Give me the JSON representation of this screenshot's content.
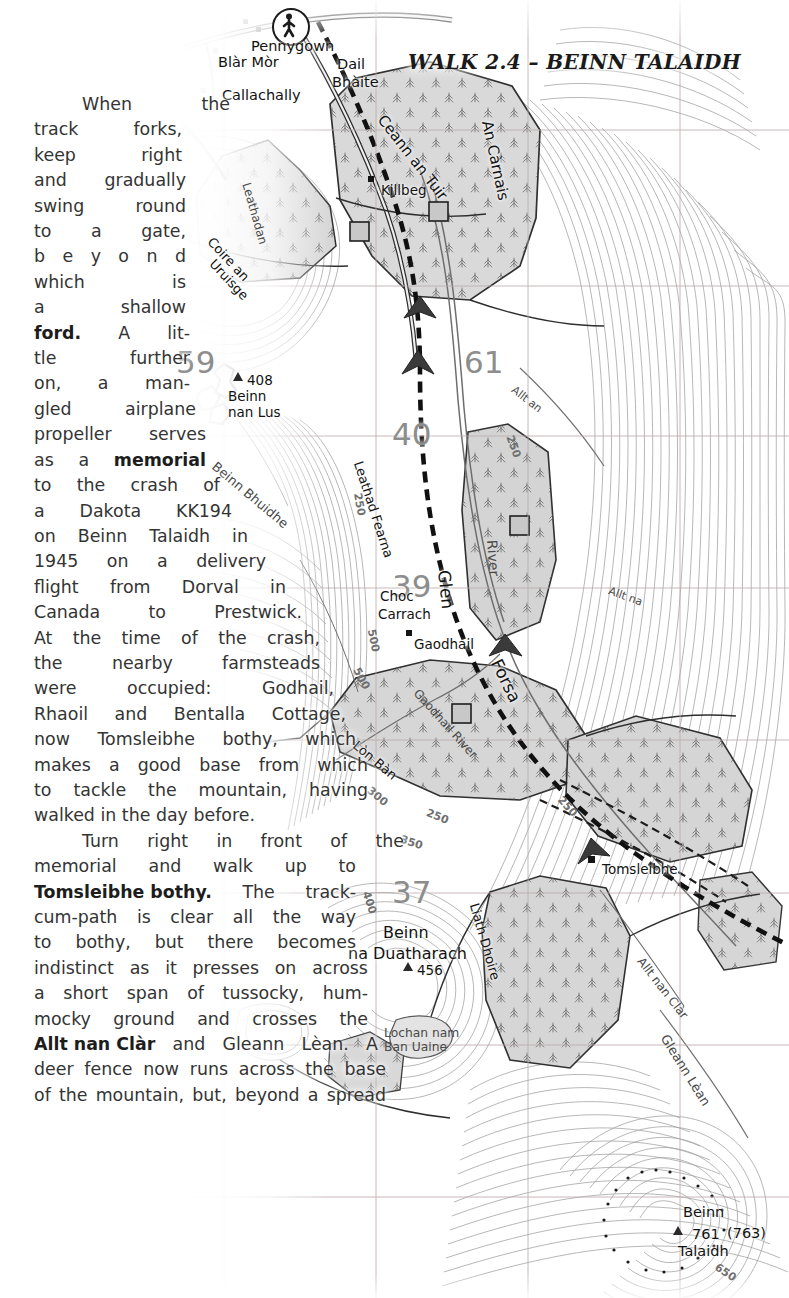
{
  "page": {
    "width": 789,
    "height": 1298,
    "background": "#ffffff"
  },
  "header": {
    "prefix": "W",
    "text_main": "ALK 2.4 – ",
    "full": "WALK 2.4 – BEINN TALAIDH",
    "parts": [
      "W",
      "ALK",
      " 2.4 – ",
      "B",
      "EINN",
      " T",
      "ALAIDH"
    ]
  },
  "article": {
    "paragraphs": [
      {
        "id": "para-1",
        "indent": true,
        "lines": [
          {
            "words": [
              "When",
              "the"
            ],
            "width_class": "w1",
            "indent": true
          },
          {
            "words": [
              "track",
              "forks,"
            ],
            "width_class": "w1"
          },
          {
            "words": [
              "keep",
              "right"
            ],
            "width_class": "w1"
          },
          {
            "words": [
              "and",
              "gradually"
            ],
            "width_class": "w2"
          },
          {
            "words": [
              "swing",
              "round"
            ],
            "width_class": "w2"
          },
          {
            "words": [
              "to",
              "a",
              "gate,"
            ],
            "width_class": "w2"
          },
          {
            "words": [
              "b",
              "e",
              "y",
              "o",
              "n",
              "d"
            ],
            "width_class": "w2"
          },
          {
            "words": [
              "which",
              "is"
            ],
            "width_class": "w2"
          },
          {
            "words": [
              "a",
              "shallow"
            ],
            "width_class": "w2"
          },
          {
            "words": [
              "ford.",
              "A",
              "lit-"
            ],
            "width_class": "w3",
            "bold_first": true
          },
          {
            "words": [
              "tle",
              "further"
            ],
            "width_class": "w3"
          },
          {
            "words": [
              "on,",
              "a",
              "man-"
            ],
            "width_class": "w3"
          },
          {
            "words": [
              "gled",
              "airplane"
            ],
            "width_class": "w4"
          },
          {
            "words": [
              "propeller",
              "serves"
            ],
            "width_class": "w5"
          },
          {
            "words": [
              "as",
              "a",
              "memorial"
            ],
            "width_class": "w5",
            "bold_last": true
          },
          {
            "words": [
              "to",
              "the",
              "crash",
              "of"
            ],
            "width_class": "w6"
          },
          {
            "words": [
              "a",
              "Dakota",
              "KK194"
            ],
            "width_class": "w7"
          },
          {
            "words": [
              "on",
              "Beinn",
              "Talaidh",
              "in"
            ],
            "width_class": "w8"
          },
          {
            "words": [
              "1945",
              "on",
              "a",
              "delivery"
            ],
            "width_class": "w9"
          },
          {
            "words": [
              "flight",
              "from",
              "Dorval",
              "in"
            ],
            "width_class": "w10"
          },
          {
            "words": [
              "Canada",
              "to",
              "Prestwick."
            ],
            "width_class": "w11"
          },
          {
            "words": [
              "At",
              "the",
              "time",
              "of",
              "the",
              "crash,"
            ],
            "width_class": "w12"
          },
          {
            "words": [
              "the",
              "nearby",
              "farmsteads"
            ],
            "width_class": "w12"
          },
          {
            "words": [
              "were",
              "occupied:",
              "Godhail,"
            ],
            "width_class": "w13"
          },
          {
            "words": [
              "Rhaoil",
              "and",
              "Bentalla",
              "Cottage,"
            ],
            "width_class": "w14"
          },
          {
            "words": [
              "now",
              "Tomsleibhe",
              "bothy,",
              "which"
            ],
            "width_class": "w15"
          },
          {
            "words": [
              "makes",
              "a",
              "good",
              "base",
              "from",
              "which"
            ],
            "width_class": "w16"
          },
          {
            "words": [
              "to",
              "tackle",
              "the",
              "mountain,",
              "having"
            ],
            "width_class": "w16"
          },
          {
            "words": [
              "walked",
              "in",
              "the",
              "day",
              "before."
            ],
            "width_class": "w16",
            "ragged": true
          }
        ]
      },
      {
        "id": "para-2",
        "indent": true,
        "lines": [
          {
            "words": [
              "Turn",
              "right",
              "in",
              "front",
              "of",
              "the"
            ],
            "width_class": "w15",
            "indent": true
          },
          {
            "words": [
              "memorial",
              "and",
              "walk",
              "up",
              "to"
            ],
            "width_class": "w15"
          },
          {
            "words": [
              "Tomsleibhe bothy.",
              "The",
              "track-"
            ],
            "width_class": "w15",
            "bold_first": true
          },
          {
            "words": [
              "cum-path",
              "is",
              "clear",
              "all",
              "the",
              "way"
            ],
            "width_class": "w15"
          },
          {
            "words": [
              "to",
              "bothy,",
              "but",
              "there",
              "becomes"
            ],
            "width_class": "w15"
          },
          {
            "words": [
              "indistinct",
              "as",
              "it",
              "presses",
              "on",
              "across"
            ],
            "width_class": "w16"
          },
          {
            "words": [
              "a",
              "short",
              "span",
              "of",
              "tussocky,",
              "hum-"
            ],
            "width_class": "w16"
          },
          {
            "words": [
              "mocky",
              "ground",
              "and",
              "crosses",
              "the"
            ],
            "width_class": "w16"
          },
          {
            "words": [
              "Allt nan Clàr",
              "and",
              "Gleann",
              "Lèan.",
              "A"
            ],
            "width_class": "w17",
            "bold_first": true
          },
          {
            "words": [
              "deer",
              "fence",
              "now",
              "runs",
              "across",
              "the",
              "base"
            ],
            "width_class": "w18"
          },
          {
            "words": [
              "of",
              "the",
              "mountain,",
              "but,",
              "beyond",
              "a",
              "spread"
            ],
            "width_class": "w18",
            "ragged": true
          }
        ]
      }
    ]
  },
  "map": {
    "type": "ordnance-survey-topographic",
    "region": "Isle of Mull, Glen Forsa",
    "colors": {
      "contour": "#8a8a8a",
      "forest_fill": "#d6d6d6",
      "forest_fill_dark": "#c4c4c4",
      "grid": "#b0a0a0",
      "road": "#2a2a2a",
      "water": "#7d7d7d",
      "label": "#121212",
      "paper": "#ffffff"
    },
    "grid_numbers": [
      {
        "label": "59",
        "x": 176,
        "y": 344
      },
      {
        "label": "61",
        "x": 464,
        "y": 344
      },
      {
        "label": "40",
        "x": 392,
        "y": 416
      },
      {
        "label": "39",
        "x": 392,
        "y": 568
      },
      {
        "label": "37",
        "x": 392,
        "y": 874
      }
    ],
    "place_labels": [
      {
        "name": "Pennygown",
        "x": 251,
        "y": 38,
        "size": "sz14"
      },
      {
        "name": "Blàr Mòr",
        "x": 218,
        "y": 54,
        "size": "sz14"
      },
      {
        "name": "Callachally",
        "x": 222,
        "y": 87,
        "size": "sz14"
      },
      {
        "name": "Dail",
        "x": 337,
        "y": 56,
        "size": "sz14"
      },
      {
        "name": "Bhàite",
        "x": 332,
        "y": 74,
        "size": "sz14"
      },
      {
        "name": "Killbeg",
        "x": 381,
        "y": 182,
        "size": "sz13"
      },
      {
        "name": "Beinn",
        "x": 228,
        "y": 388,
        "size": "sz13"
      },
      {
        "name": "nan Lus",
        "x": 228,
        "y": 404,
        "size": "sz13"
      },
      {
        "name": "408",
        "x": 247,
        "y": 374,
        "size": "sz13"
      },
      {
        "name": "Choc",
        "x": 380,
        "y": 588,
        "size": "sz13"
      },
      {
        "name": "Carrach",
        "x": 378,
        "y": 606,
        "size": "sz13"
      },
      {
        "name": "Gaodhail",
        "x": 414,
        "y": 636,
        "size": "sz13"
      },
      {
        "name": "Tomsleibhe",
        "x": 602,
        "y": 861,
        "size": "sz13"
      },
      {
        "name": "Beinn",
        "x": 383,
        "y": 923,
        "size": "sz15"
      },
      {
        "name": "na Duatharach",
        "x": 348,
        "y": 944,
        "size": "sz15"
      },
      {
        "name": "456",
        "x": 417,
        "y": 966,
        "size": "sz13"
      },
      {
        "name": "Lochan nam",
        "x": 384,
        "y": 1026,
        "size": "sz12"
      },
      {
        "name": "Ban Uaine",
        "x": 384,
        "y": 1040,
        "size": "sz12"
      },
      {
        "name": "Beinn",
        "x": 683,
        "y": 1208,
        "size": "sz14"
      },
      {
        "name": "761",
        "x": 692,
        "y": 1230,
        "size": "sz14"
      },
      {
        "name": "(763)",
        "x": 727,
        "y": 1229,
        "size": "sz14"
      },
      {
        "name": "Talaidh",
        "x": 678,
        "y": 1245,
        "size": "sz14"
      }
    ],
    "curved_labels": [
      {
        "name": "Ceann an Tuir",
        "x": 381,
        "y": 108,
        "rotate": 52,
        "size": 15
      },
      {
        "name": "An Càrnais",
        "x": 487,
        "y": 112,
        "rotate": 78,
        "size": 15
      },
      {
        "name": "Leathadan",
        "x": 246,
        "y": 176,
        "rotate": 74,
        "size": 12
      },
      {
        "name": "Coire an",
        "x": 210,
        "y": 232,
        "rotate": 47,
        "size": 13
      },
      {
        "name": "Uruisge",
        "x": 212,
        "y": 254,
        "rotate": 47,
        "size": 13
      },
      {
        "name": "Beinn Bhuidhe",
        "x": 214,
        "y": 457,
        "rotate": 40,
        "size": 13
      },
      {
        "name": "Leathad Fearna",
        "x": 358,
        "y": 454,
        "rotate": 72,
        "size": 13
      },
      {
        "name": "Glen",
        "x": 444,
        "y": 560,
        "rotate": 84,
        "size": 17
      },
      {
        "name": "River",
        "x": 490,
        "y": 532,
        "rotate": 86,
        "size": 14
      },
      {
        "name": "Forsa",
        "x": 494,
        "y": 650,
        "rotate": 64,
        "size": 17
      },
      {
        "name": "Gaodhail River",
        "x": 416,
        "y": 684,
        "rotate": 48,
        "size": 12
      },
      {
        "name": "Lòn Bàn",
        "x": 355,
        "y": 736,
        "rotate": 40,
        "size": 13
      },
      {
        "name": "Allt an",
        "x": 513,
        "y": 382,
        "rotate": 38,
        "size": 11
      },
      {
        "name": "Allt na",
        "x": 609,
        "y": 584,
        "rotate": 20,
        "size": 11
      },
      {
        "name": "Liath Dhoire",
        "x": 474,
        "y": 896,
        "rotate": 74,
        "size": 13
      },
      {
        "name": "Allt nan Clàr",
        "x": 640,
        "y": 952,
        "rotate": 52,
        "size": 12
      },
      {
        "name": "Gleann Lèan",
        "x": 664,
        "y": 1028,
        "rotate": 58,
        "size": 13
      }
    ],
    "contour_values": [
      {
        "label": "250",
        "x": 348,
        "y": 498,
        "rotate": 80
      },
      {
        "label": "250",
        "x": 502,
        "y": 440,
        "rotate": 70
      },
      {
        "label": "500",
        "x": 362,
        "y": 634,
        "rotate": 78
      },
      {
        "label": "500",
        "x": 350,
        "y": 672,
        "rotate": 62
      },
      {
        "label": "300",
        "x": 366,
        "y": 790,
        "rotate": 40
      },
      {
        "label": "250",
        "x": 426,
        "y": 810,
        "rotate": 22
      },
      {
        "label": "350",
        "x": 400,
        "y": 836,
        "rotate": 18
      },
      {
        "label": "400",
        "x": 358,
        "y": 896,
        "rotate": 72
      },
      {
        "label": "650",
        "x": 714,
        "y": 1272,
        "rotate": 34
      },
      {
        "label": "250",
        "x": 556,
        "y": 800,
        "rotate": 48
      }
    ],
    "symbols": [
      {
        "type": "walker-badge",
        "x": 272,
        "y": 10
      },
      {
        "type": "trig-point",
        "x": 236,
        "y": 374
      },
      {
        "type": "trig-point",
        "x": 404,
        "y": 966
      },
      {
        "type": "trig-point",
        "x": 675,
        "y": 1230
      }
    ]
  }
}
